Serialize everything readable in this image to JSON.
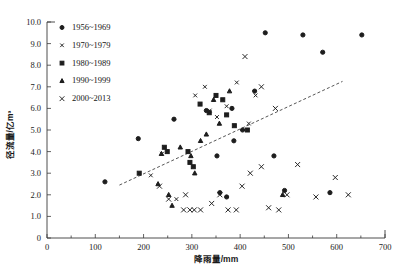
{
  "chart_data": {
    "type": "scatter",
    "title": "",
    "xlabel": "降雨量/mm",
    "ylabel": "径流量/亿m³",
    "xlim": [
      0,
      700
    ],
    "ylim": [
      0,
      10
    ],
    "xticks": [
      0,
      100,
      200,
      300,
      400,
      500,
      600,
      700
    ],
    "xticklabels": [
      "0",
      "100",
      "200",
      "300",
      "400",
      "500",
      "600",
      "700"
    ],
    "yticks": [
      0,
      1,
      2,
      3,
      4,
      5,
      6,
      7,
      8,
      9,
      10
    ],
    "yticklabels": [
      "0",
      "1.0",
      "2.0",
      "3.0",
      "4.0",
      "5.0",
      "6.0",
      "7.0",
      "8.0",
      "9.0",
      "10.0"
    ],
    "grid": false,
    "legend_position": "upper-left",
    "legend_entries": [
      {
        "label": "1956~1969",
        "marker": "filled-circle"
      },
      {
        "label": "1970~1979",
        "marker": "small-x"
      },
      {
        "label": "1980~1989",
        "marker": "filled-square"
      },
      {
        "label": "1990~1999",
        "marker": "filled-triangle"
      },
      {
        "label": "2000~2013",
        "marker": "cross-x"
      }
    ],
    "series": [
      {
        "name": "1956~1969",
        "marker": "filled-circle",
        "points": [
          [
            189,
            4.6
          ],
          [
            263,
            5.5
          ],
          [
            330,
            5.9
          ],
          [
            352,
            3.8
          ],
          [
            383,
            6.0
          ],
          [
            387,
            4.5
          ],
          [
            405,
            5.0
          ],
          [
            430,
            6.8
          ],
          [
            452,
            9.5
          ],
          [
            470,
            3.8
          ],
          [
            492,
            2.2
          ],
          [
            530,
            9.4
          ],
          [
            571,
            8.6
          ],
          [
            586,
            2.1
          ],
          [
            652,
            9.4
          ],
          [
            120,
            2.6
          ],
          [
            358,
            2.1
          ],
          [
            372,
            1.9
          ]
        ]
      },
      {
        "name": "1970~1979",
        "marker": "small-x",
        "points": [
          [
            238,
            3.9
          ],
          [
            307,
            6.6
          ],
          [
            327,
            7.0
          ],
          [
            337,
            5.9
          ],
          [
            352,
            5.6
          ],
          [
            372,
            6.1
          ],
          [
            393,
            7.2
          ],
          [
            418,
            5.3
          ],
          [
            432,
            6.6
          ],
          [
            268,
            1.8
          ],
          [
            215,
            2.9
          ]
        ]
      },
      {
        "name": "1980~1989",
        "marker": "filled-square",
        "points": [
          [
            243,
            4.2
          ],
          [
            249,
            4.0
          ],
          [
            292,
            4.0
          ],
          [
            317,
            6.2
          ],
          [
            336,
            5.8
          ],
          [
            350,
            6.6
          ],
          [
            364,
            6.4
          ],
          [
            372,
            5.7
          ],
          [
            388,
            5.2
          ],
          [
            415,
            5.0
          ],
          [
            296,
            3.5
          ],
          [
            303,
            3.3
          ],
          [
            191,
            3.0
          ]
        ]
      },
      {
        "name": "1990~1999",
        "marker": "filled-triangle",
        "points": [
          [
            237,
            3.9
          ],
          [
            276,
            4.2
          ],
          [
            298,
            3.8
          ],
          [
            318,
            4.5
          ],
          [
            330,
            4.8
          ],
          [
            345,
            6.4
          ],
          [
            357,
            5.3
          ],
          [
            378,
            6.8
          ],
          [
            230,
            2.5
          ],
          [
            259,
            1.5
          ],
          [
            306,
            3.0
          ],
          [
            488,
            2.0
          ],
          [
            252,
            2.0
          ]
        ]
      },
      {
        "name": "2000~2013",
        "marker": "cross-x",
        "points": [
          [
            283,
            1.3
          ],
          [
            296,
            1.3
          ],
          [
            305,
            1.3
          ],
          [
            318,
            1.3
          ],
          [
            341,
            1.6
          ],
          [
            358,
            2.0
          ],
          [
            375,
            1.3
          ],
          [
            392,
            1.3
          ],
          [
            404,
            2.4
          ],
          [
            421,
            3.0
          ],
          [
            444,
            3.3
          ],
          [
            459,
            1.4
          ],
          [
            480,
            1.3
          ],
          [
            497,
            2.0
          ],
          [
            519,
            3.4
          ],
          [
            252,
            1.8
          ],
          [
            233,
            2.4
          ],
          [
            287,
            2.0
          ],
          [
            410,
            8.4
          ],
          [
            444,
            7.0
          ],
          [
            473,
            6.0
          ],
          [
            557,
            1.9
          ],
          [
            597,
            2.8
          ],
          [
            624,
            2.0
          ]
        ]
      }
    ],
    "trendline": {
      "type": "dashed-linear",
      "x_start": 150,
      "y_start": 2.45,
      "x_end": 612,
      "y_end": 7.25
    }
  }
}
